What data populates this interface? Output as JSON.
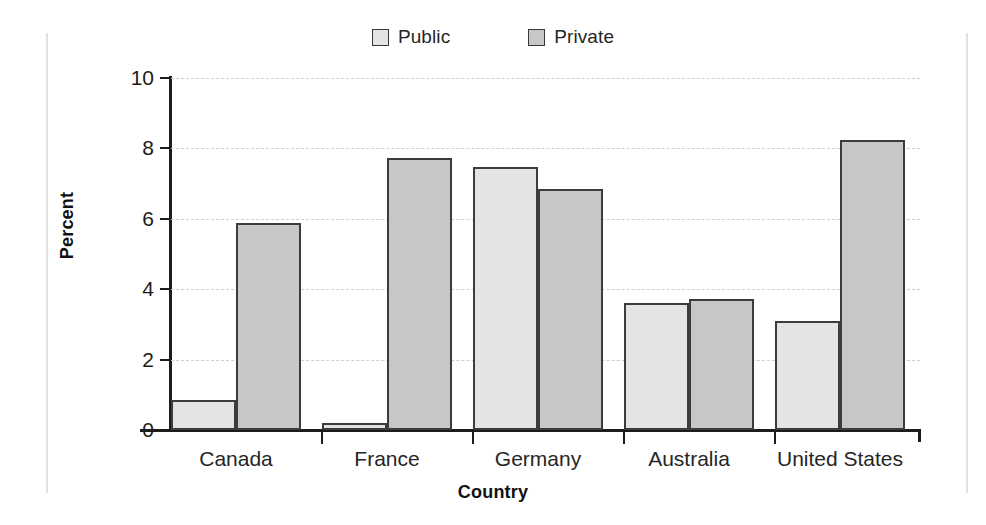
{
  "chart_data": {
    "type": "bar",
    "title": "",
    "xlabel": "Country",
    "ylabel": "Percent",
    "ylim": [
      0,
      10
    ],
    "yticks": [
      0,
      2,
      4,
      6,
      8,
      10
    ],
    "grid": true,
    "legend_position": "top-center",
    "categories": [
      "Canada",
      "France",
      "Germany",
      "Australia",
      "United States"
    ],
    "series": [
      {
        "name": "Public",
        "color": "#e4e4e4",
        "values": [
          0.85,
          0.2,
          7.48,
          3.6,
          3.09
        ]
      },
      {
        "name": "Private",
        "color": "#c7c7c7",
        "values": [
          5.88,
          7.74,
          6.86,
          3.71,
          8.25
        ]
      }
    ]
  },
  "legend": {
    "items": [
      {
        "label": "Public",
        "swatch": "legend-swatch-public"
      },
      {
        "label": "Private",
        "swatch": "legend-swatch-private"
      }
    ]
  },
  "axes": {
    "y": {
      "title": "Percent",
      "tick_labels": [
        "10",
        "8",
        "6",
        "4",
        "2",
        "0"
      ]
    },
    "x": {
      "title": "Country",
      "tick_labels": [
        "Canada",
        "France",
        "Germany",
        "Australia",
        "United States"
      ]
    }
  }
}
